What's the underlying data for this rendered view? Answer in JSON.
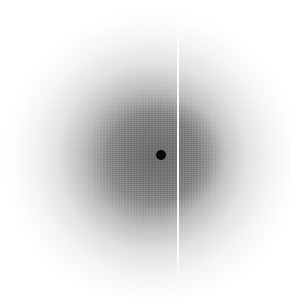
{
  "image": {
    "description": "Diffuse radial scattering pattern with dark central spot and vertical bright streak",
    "width": 290,
    "height": 297,
    "colors": {
      "background": "#ffffff",
      "halo_center": "#606060",
      "beamstop": "#0a0a0a",
      "streak": "#f5f5f5"
    },
    "features": {
      "central_spot": {
        "x": 161,
        "y": 155,
        "radius": 5
      },
      "halo": {
        "center_x": 152,
        "center_y": 158,
        "radius": 148
      },
      "vertical_streak": {
        "x": 178,
        "y_start": 18,
        "y_end": 286,
        "width": 2
      }
    }
  }
}
